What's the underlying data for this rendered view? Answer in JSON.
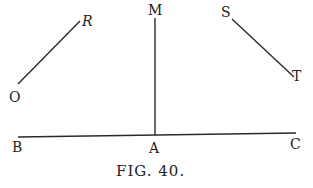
{
  "figure": {
    "caption": "Fig. 40.",
    "caption_display": "FIG. 40."
  },
  "points": {
    "O": {
      "label": "O",
      "x": 16,
      "y": 98
    },
    "R": {
      "label": "R",
      "x": 84,
      "y": 24
    },
    "M": {
      "label": "M",
      "x": 155,
      "y": 13
    },
    "S": {
      "label": "S",
      "x": 225,
      "y": 16
    },
    "T": {
      "label": "T",
      "x": 298,
      "y": 79
    },
    "B": {
      "label": "B",
      "x": 18,
      "y": 155
    },
    "A": {
      "label": "A",
      "x": 155,
      "y": 155
    },
    "C": {
      "label": "C",
      "x": 296,
      "y": 150
    }
  },
  "segments": [
    {
      "name": "OR",
      "from": "O",
      "to": "R"
    },
    {
      "name": "MA",
      "from": "M",
      "to": "A"
    },
    {
      "name": "ST",
      "from": "S",
      "to": "T"
    },
    {
      "name": "BC",
      "from": "B",
      "to": "C"
    }
  ]
}
